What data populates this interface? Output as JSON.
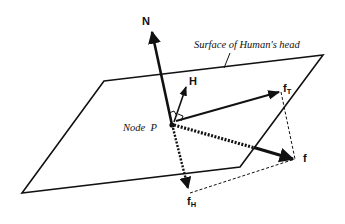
{
  "diagram": {
    "title": "",
    "surface_label": "Surface of Human's head",
    "node_label": "Node  P",
    "vectors": {
      "N": {
        "label": "N"
      },
      "H": {
        "label": "H"
      },
      "fT": {
        "label": "f",
        "subscript": "T"
      },
      "f": {
        "label": "f"
      },
      "fH": {
        "label": "f",
        "subscript": "H"
      }
    },
    "colors": {
      "line": "#111111",
      "background": "#ffffff"
    }
  }
}
